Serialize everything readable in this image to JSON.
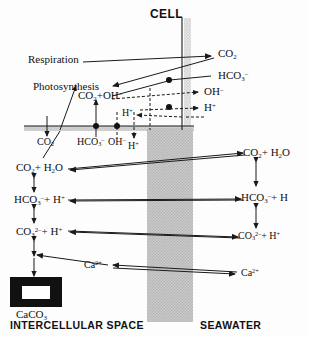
{
  "figure": {
    "title_top": "CELL",
    "region_left": "INTERCELLULAR SPACE",
    "region_right": "SEAWATER",
    "colors": {
      "stroke": "#1a1a1a",
      "seawater_band": "#c9c9c9",
      "membrane_band": "#d8d8d8",
      "cell_band": "#e6e6e6",
      "solid_block": "#111111"
    }
  },
  "processes": {
    "respiration": "Respiration",
    "photosynthesis": "Photosynthesis"
  },
  "cell_interior": {
    "reaction": {
      "part1": "CO",
      "sub1": "2",
      "plus": "+OH",
      "sup1": "–"
    }
  },
  "cell_species": [
    {
      "name": "CO2",
      "base": "CO",
      "sub": "2",
      "sup": ""
    },
    {
      "name": "HCO3-",
      "base": "HCO",
      "sub": "3",
      "sup": "–"
    },
    {
      "name": "OH-",
      "base": "OH",
      "sub": "",
      "sup": "–"
    },
    {
      "name": "H+",
      "base": "H",
      "sub": "",
      "sup": "+"
    }
  ],
  "membrane_species": [
    {
      "name": "CO2",
      "base": "CO",
      "sub": "2",
      "sup": ""
    },
    {
      "name": "HCO3-",
      "base": "HCO",
      "sub": "3",
      "sup": "–"
    },
    {
      "name": "OH-",
      "base": "OH",
      "sub": "",
      "sup": "–"
    },
    {
      "name": "H+",
      "base": "H",
      "sub": "",
      "sup": "+"
    }
  ],
  "inner_Hplus": {
    "base": "H",
    "sup": "+"
  },
  "intercellular_column": [
    {
      "name": "co2-h2o",
      "base": "CO",
      "sub": "2",
      "tail": "+ H",
      "tail_sub": "2",
      "tail2": "O"
    },
    {
      "name": "hco3-h",
      "base": "HCO",
      "sub": "3",
      "sup": "–",
      "tail": "+ H",
      "tail_sup": "+"
    },
    {
      "name": "co3-h",
      "base": "CO",
      "sub": "3",
      "sup": "2–",
      "tail": "+ H",
      "tail_sup": "+"
    }
  ],
  "seawater_column": [
    {
      "name": "co2-h2o",
      "base": "CO",
      "sub": "2",
      "tail": "+ H",
      "tail_sub": "2",
      "tail2": "O"
    },
    {
      "name": "hco3-h",
      "base": "HCO",
      "sub": "3",
      "sup": "–",
      "tail": "+ H",
      "tail_sup": ""
    },
    {
      "name": "co3-h",
      "base": "CO",
      "sub": "3",
      "sup": "2–",
      "tail": "+ H",
      "tail_sup": "+"
    }
  ],
  "calcium": {
    "left": {
      "base": "Ca",
      "sup": "2+"
    },
    "right": {
      "base": "Ca",
      "sup": "2+"
    }
  },
  "mineral": {
    "label_base": "CaCO",
    "label_sub": "3"
  }
}
